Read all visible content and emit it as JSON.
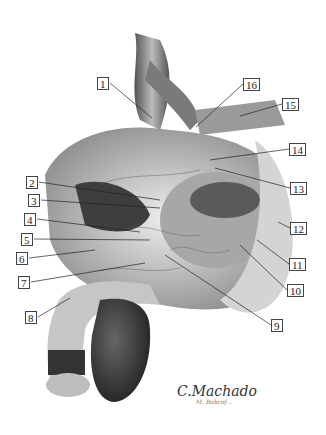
{
  "figure": {
    "type": "anatomical illustration (sagittal view, male pelvis, grayscale)",
    "signature": "C.Machado",
    "co_signature": "M. Bobrof..."
  },
  "labels": [
    {
      "n": "1",
      "x": 97,
      "y": 77,
      "tx": 152,
      "ty": 118
    },
    {
      "n": "2",
      "x": 26,
      "y": 176,
      "tx": 160,
      "ty": 200
    },
    {
      "n": "3",
      "x": 28,
      "y": 194,
      "tx": 160,
      "ty": 208
    },
    {
      "n": "4",
      "x": 24,
      "y": 213,
      "tx": 140,
      "ty": 232
    },
    {
      "n": "5",
      "x": 21,
      "y": 233,
      "tx": 150,
      "ty": 240
    },
    {
      "n": "6",
      "x": 16,
      "y": 252,
      "tx": 95,
      "ty": 250
    },
    {
      "n": "7",
      "x": 18,
      "y": 276,
      "tx": 145,
      "ty": 263
    },
    {
      "n": "8",
      "x": 25,
      "y": 311,
      "tx": 70,
      "ty": 298
    },
    {
      "n": "9",
      "x": 271,
      "y": 319,
      "tx": 165,
      "ty": 255
    },
    {
      "n": "10",
      "x": 287,
      "y": 284,
      "tx": 240,
      "ty": 245
    },
    {
      "n": "11",
      "x": 289,
      "y": 258,
      "tx": 257,
      "ty": 240
    },
    {
      "n": "12",
      "x": 290,
      "y": 222,
      "tx": 278,
      "ty": 222
    },
    {
      "n": "13",
      "x": 290,
      "y": 182,
      "tx": 215,
      "ty": 168
    },
    {
      "n": "14",
      "x": 289,
      "y": 143,
      "tx": 210,
      "ty": 160
    },
    {
      "n": "15",
      "x": 282,
      "y": 98,
      "tx": 240,
      "ty": 116
    },
    {
      "n": "16",
      "x": 243,
      "y": 78,
      "tx": 196,
      "ty": 127
    }
  ]
}
